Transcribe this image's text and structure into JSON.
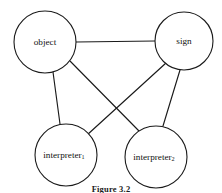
{
  "figure": {
    "caption": "Figure 3.2",
    "background_color": "#ffffff",
    "stroke_color": "#1a1a1a"
  },
  "nodes": {
    "object": {
      "label": "object",
      "subscript": "",
      "cx": 45,
      "cy": 42,
      "r": 31
    },
    "sign": {
      "label": "sign",
      "subscript": "",
      "cx": 184,
      "cy": 41,
      "r": 29
    },
    "interpreter1": {
      "label": "interpreter",
      "subscript": "1",
      "cx": 66,
      "cy": 155,
      "r": 31
    },
    "interpreter2": {
      "label": "interpreter",
      "subscript": "2",
      "cx": 156,
      "cy": 157,
      "r": 31
    }
  },
  "edges": [
    {
      "name": "object-sign",
      "from": "object",
      "to": "sign"
    },
    {
      "name": "object-interpreter1",
      "from": "object",
      "to": "interpreter1"
    },
    {
      "name": "object-interpreter2",
      "from": "object",
      "to": "interpreter2"
    },
    {
      "name": "sign-interpreter1",
      "from": "sign",
      "to": "interpreter1"
    },
    {
      "name": "sign-interpreter2",
      "from": "sign",
      "to": "interpreter2"
    }
  ]
}
